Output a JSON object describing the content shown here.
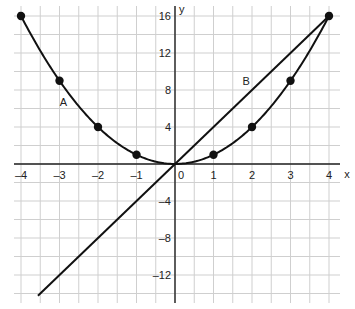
{
  "chart_data": {
    "type": "line",
    "title": "",
    "xlabel": "x",
    "ylabel": "y",
    "xlim": [
      -4.2,
      4.6
    ],
    "ylim": [
      -15,
      16.5
    ],
    "grid": true,
    "x_ticks": [
      -4,
      -3,
      -2,
      -1,
      0,
      1,
      2,
      3,
      4
    ],
    "x_tick_labels": [
      "–4",
      "–3",
      "–2",
      "–1",
      "0",
      "1",
      "2",
      "3",
      "4"
    ],
    "y_ticks": [
      16,
      12,
      8,
      4,
      -4,
      -8,
      -12
    ],
    "y_tick_labels": [
      "16",
      "12",
      "8",
      "4",
      "–4",
      "–8",
      "–12"
    ],
    "series": [
      {
        "name": "A",
        "equation": "y = x^2",
        "curve": true,
        "markers": true,
        "points": [
          [
            -4,
            16
          ],
          [
            -3,
            9
          ],
          [
            -2,
            4
          ],
          [
            -1,
            1
          ],
          [
            1,
            1
          ],
          [
            2,
            4
          ],
          [
            3,
            9
          ],
          [
            4,
            16
          ]
        ],
        "label_position": [
          -2.9,
          6.3
        ]
      },
      {
        "name": "B",
        "equation": "y = 4x",
        "curve": false,
        "markers": false,
        "points": [
          [
            -3.56,
            -14.24
          ],
          [
            4,
            16
          ]
        ],
        "label_position": [
          1.85,
          8.5
        ]
      }
    ],
    "colors": {
      "line": "#111111",
      "grid": "#cfcfcf",
      "axis": "#222222",
      "background": "#ffffff"
    }
  }
}
